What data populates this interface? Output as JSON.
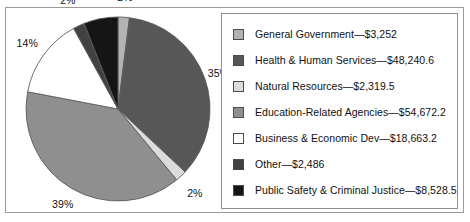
{
  "figure": {
    "clipped_caption": "",
    "border_color": "#9a9a9a"
  },
  "chart_data": {
    "type": "pie",
    "title": "",
    "subtitle": "",
    "xlabel": "",
    "ylabel": "",
    "legend_position": "right",
    "grid": false,
    "units": "$ in millions",
    "start_angle_deg": 0,
    "direction": "clockwise",
    "categories": [
      "General Government",
      "Health & Human Services",
      "Natural Resources",
      "Education-Related Agencies",
      "Business & Economic Dev",
      "Other",
      "Public Safety & Criminal Justice"
    ],
    "values": [
      3252,
      48240.6,
      2319.5,
      54672.2,
      18663.2,
      2486,
      8528.5
    ],
    "value_labels": [
      "$3,252",
      "$48,240.6",
      "$2,319.5",
      "$54,672.2",
      "$18,663.2",
      "$2,486",
      "$8,528.5"
    ],
    "percent_labels": [
      "2%",
      "35%",
      "2%",
      "39%",
      "14%",
      "2%",
      "6%"
    ],
    "percents": [
      2,
      35,
      2,
      39,
      14,
      2,
      6
    ],
    "colors": [
      "#b3b3b3",
      "#575757",
      "#dcdcdc",
      "#8f8f8f",
      "#ffffff",
      "#414141",
      "#151515"
    ],
    "slices": [
      {
        "label": "General Government",
        "percent": 2,
        "percent_label": "2%",
        "value": 3252,
        "value_label": "$3,252",
        "color": "#b3b3b3"
      },
      {
        "label": "Health & Human Services",
        "percent": 35,
        "percent_label": "35%",
        "value": 48240.6,
        "value_label": "$48,240.6",
        "color": "#575757"
      },
      {
        "label": "Natural Resources",
        "percent": 2,
        "percent_label": "2%",
        "value": 2319.5,
        "value_label": "$2,319.5",
        "color": "#dcdcdc"
      },
      {
        "label": "Education-Related Agencies",
        "percent": 39,
        "percent_label": "39%",
        "value": 54672.2,
        "value_label": "$54,672.2",
        "color": "#8f8f8f"
      },
      {
        "label": "Business & Economic Dev",
        "percent": 14,
        "percent_label": "14%",
        "value": 18663.2,
        "value_label": "$18,663.2",
        "color": "#ffffff"
      },
      {
        "label": "Other",
        "percent": 2,
        "percent_label": "2%",
        "value": 2486,
        "value_label": "$2,486",
        "color": "#414141"
      },
      {
        "label": "Public Safety & Criminal Justice",
        "percent": 6,
        "percent_label": "6%",
        "value": 8528.5,
        "value_label": "$8,528.5",
        "color": "#151515"
      }
    ]
  },
  "legend": {
    "entries": [
      {
        "text": "General Government—$3,252",
        "color": "#b3b3b3"
      },
      {
        "text": "Health & Human Services—$48,240.6",
        "color": "#575757"
      },
      {
        "text": "Natural Resources—$2,319.5",
        "color": "#dcdcdc"
      },
      {
        "text": "Education-Related Agencies—$54,672.2",
        "color": "#8f8f8f"
      },
      {
        "text": "Business & Economic Dev—$18,663.2",
        "color": "#ffffff"
      },
      {
        "text": "Other—$2,486",
        "color": "#414141"
      },
      {
        "text": "Public Safety & Criminal Justice—$8,528.5",
        "color": "#151515"
      }
    ]
  }
}
